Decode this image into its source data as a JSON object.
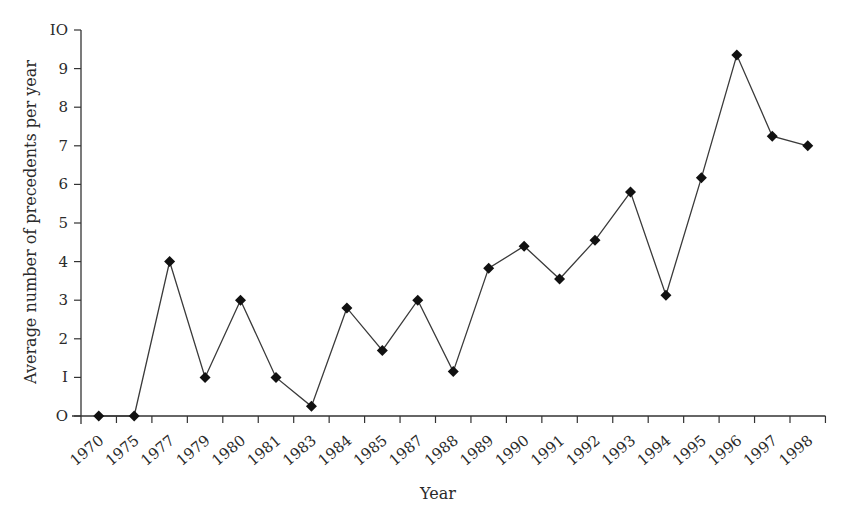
{
  "chart_data": {
    "type": "line",
    "title": "",
    "xlabel": "Year",
    "ylabel": "Average number of precedents per year",
    "categories": [
      "1970",
      "1975",
      "1977",
      "1979",
      "1980",
      "1981",
      "1983",
      "1984",
      "1985",
      "1987",
      "1988",
      "1989",
      "1990",
      "1991",
      "1992",
      "1993",
      "1994",
      "1995",
      "1996",
      "1997",
      "1998"
    ],
    "series": [
      {
        "name": "Average number of precedents per year",
        "values": [
          0,
          0,
          4.0,
          1.0,
          3.0,
          1.0,
          0.25,
          2.8,
          1.7,
          3.0,
          1.15,
          3.83,
          4.4,
          3.55,
          4.55,
          5.8,
          3.13,
          6.17,
          9.35,
          7.25,
          7.0
        ],
        "marker": "diamond",
        "color": "#111111"
      }
    ],
    "ylim": [
      0,
      10
    ],
    "yticks": [
      0,
      1,
      2,
      3,
      4,
      5,
      6,
      7,
      8,
      9,
      10
    ],
    "ytick_labels": [
      "O",
      "I",
      "2",
      "3",
      "4",
      "5",
      "6",
      "7",
      "8",
      "9",
      "IO"
    ],
    "grid": false,
    "legend": "none"
  }
}
